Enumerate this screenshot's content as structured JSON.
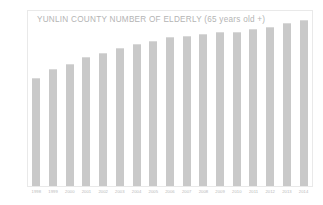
{
  "chart_data": {
    "type": "bar",
    "title": "YUNLIN  COUNTY NUMBER OF ELDERLY (65 years old +)",
    "xlabel": "",
    "ylabel": "",
    "grid": false,
    "legend": null,
    "bar_color": "#c9c9c9",
    "frame_color": "#e9e9e9",
    "title_color": "#b4b4b4",
    "tick_color": "#b9b9b9",
    "ylim": [
      0,
      100
    ],
    "categories": [
      "1998",
      "1999",
      "2000",
      "2001",
      "2002",
      "2003",
      "2004",
      "2005",
      "2006",
      "2007",
      "2008",
      "2009",
      "2010",
      "2011",
      "2012",
      "2013",
      "2014"
    ],
    "values": [
      62,
      67,
      70,
      74,
      76,
      79,
      81,
      83,
      85,
      86,
      87,
      88,
      88,
      90,
      91,
      93,
      95
    ],
    "y_tick_labels": [
      "",
      "",
      "",
      "",
      "",
      "",
      "",
      "",
      "",
      "",
      "",
      "",
      "",
      "",
      "",
      "",
      "",
      "",
      "",
      "",
      "",
      "",
      "",
      "",
      "",
      ""
    ]
  },
  "axis": {
    "x_labels": [
      "1998",
      "1999",
      "2000",
      "2001",
      "2002",
      "2003",
      "2004",
      "2005",
      "2006",
      "2007",
      "2008",
      "2009",
      "2010",
      "2011",
      "2012",
      "2013",
      "2014"
    ]
  }
}
